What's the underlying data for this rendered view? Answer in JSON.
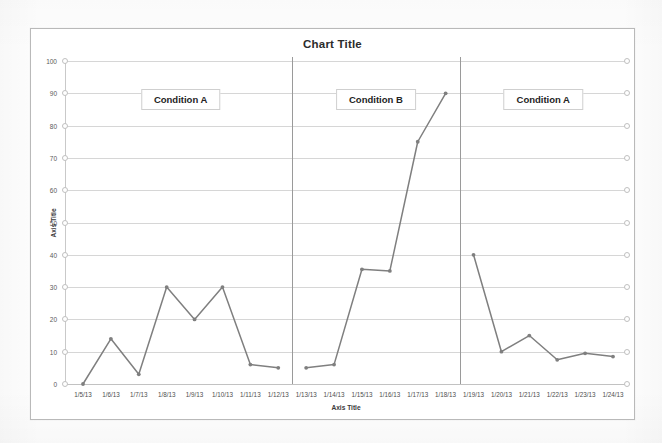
{
  "chart_data": {
    "type": "line",
    "title": "Chart Title",
    "xlabel": "Axis Title",
    "ylabel": "Axis Title",
    "ylim": [
      0,
      100
    ],
    "ytick_step": 10,
    "yticks": [
      0,
      10,
      20,
      30,
      40,
      50,
      60,
      70,
      80,
      90,
      100
    ],
    "grid": true,
    "legend": "none",
    "categories": [
      "1/5/13",
      "1/6/13",
      "1/7/13",
      "1/8/13",
      "1/9/13",
      "1/10/13",
      "1/11/13",
      "1/12/13",
      "1/13/13",
      "1/14/13",
      "1/15/13",
      "1/16/13",
      "1/17/13",
      "1/18/13",
      "1/19/13",
      "1/20/13",
      "1/21/13",
      "1/22/13",
      "1/23/13",
      "1/24/13"
    ],
    "values": [
      0,
      14,
      3,
      30,
      20,
      30,
      6,
      5,
      5,
      6,
      35.5,
      35,
      75,
      90,
      40,
      10,
      15,
      7.5,
      9.5,
      8.5
    ],
    "series": [
      {
        "name": "Series 1",
        "color": "#7f7f7f",
        "marker": "circle",
        "segments": [
          {
            "phase": "Condition A",
            "categories": [
              "1/5/13",
              "1/6/13",
              "1/7/13",
              "1/8/13",
              "1/9/13",
              "1/10/13",
              "1/11/13",
              "1/12/13"
            ],
            "values": [
              0,
              14,
              3,
              30,
              20,
              30,
              6,
              5
            ]
          },
          {
            "phase": "Condition B",
            "categories": [
              "1/13/13",
              "1/14/13",
              "1/15/13",
              "1/16/13",
              "1/17/13",
              "1/18/13"
            ],
            "values": [
              5,
              6,
              35.5,
              35,
              75,
              90
            ]
          },
          {
            "phase": "Condition A",
            "categories": [
              "1/19/13",
              "1/20/13",
              "1/21/13",
              "1/22/13",
              "1/23/13",
              "1/24/13"
            ],
            "values": [
              40,
              10,
              15,
              7.5,
              9.5,
              8.5
            ]
          }
        ]
      }
    ],
    "annotations": [
      {
        "label": "Condition A",
        "span_start": "1/5/13",
        "span_end": "1/12/13"
      },
      {
        "label": "Condition B",
        "span_start": "1/13/13",
        "span_end": "1/18/13"
      },
      {
        "label": "Condition A",
        "span_start": "1/19/13",
        "span_end": "1/24/13"
      }
    ],
    "phase_dividers": [
      "between 1/12/13 and 1/13/13",
      "between 1/18/13 and 1/19/13"
    ],
    "colors": {
      "line": "#7f7f7f",
      "gridline": "#d6d6d6",
      "divider": "#9a9a9a",
      "text": "#2b2b2b",
      "plot_background": "#ffffff",
      "frame_border": "#b9b9b9"
    }
  }
}
